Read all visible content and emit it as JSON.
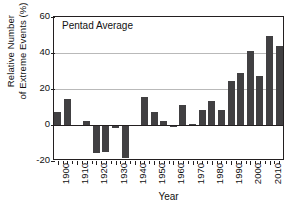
{
  "chart_data": {
    "type": "bar",
    "title": "",
    "annotation": "Pentad Average",
    "xlabel": "Year",
    "ylabel_line1": "Relative Number",
    "ylabel_line2": "of Extreme Events (%)",
    "ylim": [
      -20,
      60
    ],
    "yticks": [
      60,
      40,
      20,
      0,
      -20
    ],
    "ytick_labels": [
      "60",
      "40",
      "20",
      "0",
      "-20"
    ],
    "xlim": [
      1898,
      2018
    ],
    "xticks": [
      1900,
      1910,
      1920,
      1930,
      1940,
      1950,
      1960,
      1970,
      1980,
      1990,
      2000,
      2010
    ],
    "xtick_labels": [
      "1900",
      "1910",
      "1920",
      "1930",
      "1940",
      "1950",
      "1960",
      "1970",
      "1980",
      "1990",
      "2000",
      "2010"
    ],
    "grid": true,
    "gridlines": [
      40,
      20
    ],
    "legend": "none",
    "bar_color": "#414042",
    "categories": [
      1900,
      1905,
      1910,
      1915,
      1920,
      1925,
      1930,
      1935,
      1940,
      1945,
      1950,
      1955,
      1960,
      1965,
      1970,
      1975,
      1980,
      1985,
      1990,
      1995,
      2000,
      2005,
      2010,
      2015
    ],
    "values": [
      7.3,
      14.7,
      -0.6,
      2.2,
      -15.5,
      -15.2,
      -1.8,
      -18.3,
      0,
      15.8,
      7.4,
      2.1,
      -1.0,
      11.2,
      0.6,
      8.2,
      13.5,
      8.1,
      24.6,
      28.8,
      41.1,
      27.2,
      49.6,
      43.8
    ]
  }
}
